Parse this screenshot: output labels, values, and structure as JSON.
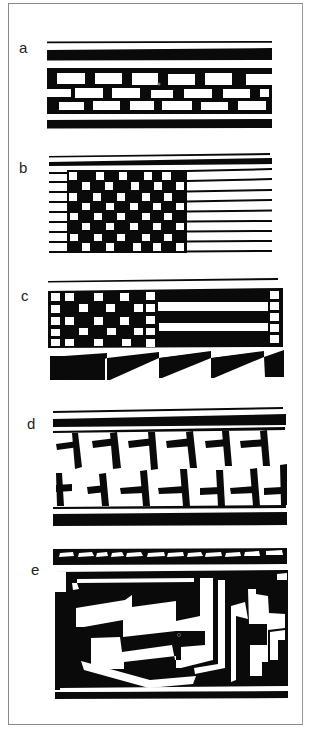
{
  "figure": {
    "panels": [
      {
        "id": "a",
        "label": "a",
        "motif": "offset brick band between framing lines"
      },
      {
        "id": "b",
        "label": "b",
        "motif": "checkerboard block with parallel horizontal lines"
      },
      {
        "id": "c",
        "label": "c",
        "motif": "checker block with stripes over sawtooth band"
      },
      {
        "id": "d",
        "label": "d",
        "motif": "interlocking hooked T-motifs between framing bars"
      },
      {
        "id": "e",
        "label": "e",
        "motif": "dentate rim band over interlocking stepped fret"
      }
    ],
    "colors": {
      "ink": "#0a0a0a",
      "paper": "#ffffff",
      "frame": "#8a8a8a"
    }
  }
}
